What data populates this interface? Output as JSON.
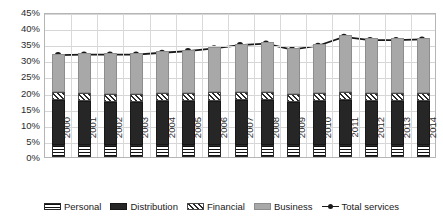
{
  "chart_data": {
    "type": "bar",
    "title": "",
    "xlabel": "",
    "ylabel": "",
    "ylim": [
      0,
      45
    ],
    "ytick_labels": [
      "45%",
      "40%",
      "35%",
      "30%",
      "25%",
      "20%",
      "15%",
      "10%",
      "5%",
      "0%"
    ],
    "ytick_values": [
      45,
      40,
      35,
      30,
      25,
      20,
      15,
      10,
      5,
      0
    ],
    "grid": true,
    "stacked": true,
    "legend_position": "bottom",
    "categories": [
      "2000",
      "2001",
      "2002",
      "2003",
      "2004",
      "2005",
      "2006",
      "2007",
      "2008",
      "2009",
      "2010",
      "2011",
      "2012",
      "2013",
      "2014"
    ],
    "series": [
      {
        "name": "Personal",
        "fill": "horizontal-stripes",
        "values": [
          3.6,
          3.6,
          3.6,
          3.6,
          3.6,
          3.6,
          3.6,
          3.6,
          3.6,
          3.6,
          3.6,
          3.6,
          3.6,
          3.6,
          3.6
        ]
      },
      {
        "name": "Distribution",
        "fill": "solid-dark",
        "values": [
          14.0,
          13.8,
          13.6,
          13.6,
          13.7,
          13.8,
          13.9,
          14.0,
          14.0,
          13.6,
          13.8,
          14.0,
          13.8,
          13.8,
          13.9
        ]
      },
      {
        "name": "Financial",
        "fill": "diagonal-hatch",
        "values": [
          2.5,
          2.5,
          2.5,
          2.5,
          2.5,
          2.5,
          2.6,
          2.6,
          2.6,
          2.5,
          2.5,
          2.6,
          2.5,
          2.5,
          2.5
        ]
      },
      {
        "name": "Business",
        "fill": "light-gray",
        "values": [
          12.0,
          12.3,
          12.5,
          12.5,
          13.0,
          13.4,
          14.1,
          15.0,
          15.5,
          14.1,
          15.1,
          17.6,
          16.9,
          16.9,
          17.0
        ]
      }
    ],
    "line_series": {
      "name": "Total services",
      "marker": "filled-circle",
      "color": "#1a1a1a",
      "values": [
        32.1,
        32.2,
        32.2,
        32.2,
        32.8,
        33.3,
        34.2,
        35.2,
        35.7,
        33.8,
        35.0,
        37.8,
        36.8,
        36.8,
        37.0
      ]
    },
    "legend": [
      {
        "label": "Personal",
        "fill": "horizontal-stripes"
      },
      {
        "label": "Distribution",
        "fill": "solid-dark"
      },
      {
        "label": "Financial",
        "fill": "diagonal-hatch"
      },
      {
        "label": "Business",
        "fill": "light-gray"
      },
      {
        "label": "Total services",
        "fill": "line-marker"
      }
    ]
  }
}
